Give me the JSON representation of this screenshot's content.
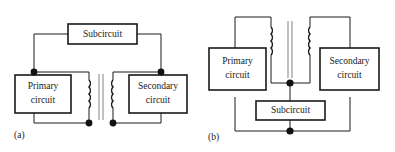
{
  "figure": {
    "type": "circuit-diagram-pair",
    "background_color": "#ffffff",
    "line_color": "#1a1a1a",
    "core_color": "#8c8c8c",
    "node_color": "#111111"
  },
  "panels": [
    {
      "id": "a",
      "caption": "(a)",
      "description": "Transformer with subcircuit bridging the primary and secondary high sides",
      "blocks": [
        {
          "name": "primary-circuit",
          "line1": "Primary",
          "line2": "circuit"
        },
        {
          "name": "secondary-circuit",
          "line1": "Secondary",
          "line2": "circuit"
        },
        {
          "name": "subcircuit",
          "line1": "Subcircuit",
          "line2": ""
        }
      ],
      "component": {
        "name": "transformer",
        "primary_turns": 4,
        "secondary_turns": 4,
        "core_lines": 2
      },
      "junction_count": 4
    },
    {
      "id": "b",
      "caption": "(b)",
      "description": "Transformer with subcircuit in the common return path",
      "blocks": [
        {
          "name": "primary-circuit",
          "line1": "Primary",
          "line2": "circuit"
        },
        {
          "name": "secondary-circuit",
          "line1": "Secondary",
          "line2": "circuit"
        },
        {
          "name": "subcircuit",
          "line1": "Subcircuit",
          "line2": ""
        }
      ],
      "component": {
        "name": "transformer",
        "primary_turns": 4,
        "secondary_turns": 4,
        "core_lines": 2
      },
      "junction_count": 2
    }
  ]
}
